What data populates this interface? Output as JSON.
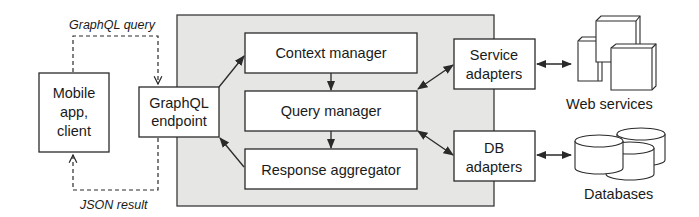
{
  "diagram": {
    "nodes": {
      "mobile_client": {
        "lines": [
          "Mobile",
          "app,",
          "client"
        ]
      },
      "graphql_endpoint": {
        "lines": [
          "GraphQL",
          "endpoint"
        ]
      },
      "context_manager": {
        "label": "Context manager"
      },
      "query_manager": {
        "label": "Query manager"
      },
      "response_aggregator": {
        "label": "Response aggregator"
      },
      "service_adapters": {
        "lines": [
          "Service",
          "adapters"
        ]
      },
      "db_adapters": {
        "lines": [
          "DB",
          "adapters"
        ]
      },
      "web_services": {
        "label": "Web services",
        "icon": "server-stack-icon"
      },
      "databases": {
        "label": "Databases",
        "icon": "database-stack-icon"
      }
    },
    "edge_labels": {
      "request": "GraphQL query",
      "response": "JSON result"
    },
    "edges": [
      {
        "from": "mobile_client",
        "to": "graphql_endpoint",
        "style": "dashed",
        "label": "GraphQL query"
      },
      {
        "from": "graphql_endpoint",
        "to": "mobile_client",
        "style": "dashed",
        "label": "JSON result"
      },
      {
        "from": "graphql_endpoint",
        "to": "context_manager",
        "style": "solid"
      },
      {
        "from": "context_manager",
        "to": "query_manager",
        "style": "solid"
      },
      {
        "from": "query_manager",
        "to": "response_aggregator",
        "style": "solid"
      },
      {
        "from": "response_aggregator",
        "to": "graphql_endpoint",
        "style": "solid"
      },
      {
        "from": "query_manager",
        "to": "service_adapters",
        "style": "solid",
        "bidirectional": true
      },
      {
        "from": "query_manager",
        "to": "db_adapters",
        "style": "solid",
        "bidirectional": true
      },
      {
        "from": "service_adapters",
        "to": "web_services",
        "style": "solid",
        "bidirectional": true
      },
      {
        "from": "db_adapters",
        "to": "databases",
        "style": "solid",
        "bidirectional": true
      }
    ],
    "colors": {
      "server_panel": "#e6e6e4",
      "stroke": "#2a2a2a",
      "box_fill": "#ffffff"
    }
  }
}
